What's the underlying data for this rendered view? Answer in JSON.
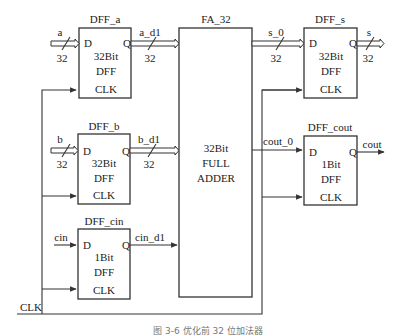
{
  "diagram": {
    "blocks": {
      "dff_a": {
        "title": "DFF_a",
        "d": "D",
        "q": "Q",
        "width_label": "32Bit",
        "type": "DFF",
        "clk": "CLK"
      },
      "dff_b": {
        "title": "DFF_b",
        "d": "D",
        "q": "Q",
        "width_label": "32Bit",
        "type": "DFF",
        "clk": "CLK"
      },
      "dff_cin": {
        "title": "DFF_cin",
        "d": "D",
        "q": "Q",
        "width_label": "1Bit",
        "type": "DFF",
        "clk": "CLK"
      },
      "fa_32": {
        "title": "FA_32",
        "line1": "32Bit",
        "line2": "FULL",
        "line3": "ADDER"
      },
      "dff_s": {
        "title": "DFF_s",
        "d": "D",
        "q": "Q",
        "width_label": "32Bit",
        "type": "DFF",
        "clk": "CLK"
      },
      "dff_cout": {
        "title": "DFF_cout",
        "d": "D",
        "q": "Q",
        "width_label": "1Bit",
        "type": "DFF",
        "clk": "CLK"
      }
    },
    "signals": {
      "a": "a",
      "a_width": "32",
      "a_d1": "a_d1",
      "a_d1_width": "32",
      "b": "b",
      "b_width": "32",
      "b_d1": "b_d1",
      "b_d1_width": "32",
      "cin": "cin",
      "cin_d1": "cin_d1",
      "s_0": "s_0",
      "s_0_width": "32",
      "s": "s",
      "s_width": "32",
      "cout_0": "cout_0",
      "cout": "cout",
      "clk": "CLK"
    },
    "caption": "图 3-6  优化前 32 位加法器"
  }
}
